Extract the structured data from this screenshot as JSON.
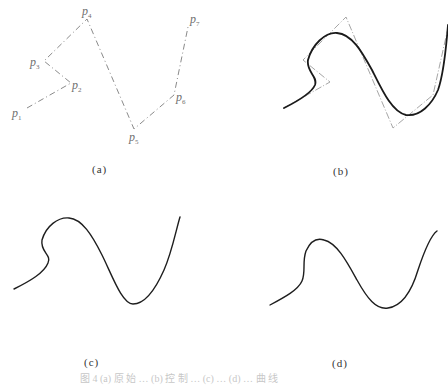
{
  "figure": {
    "panels": [
      {
        "id": "a",
        "label": "(a)",
        "content": "control polygon P1..P7"
      },
      {
        "id": "b",
        "label": "(b)",
        "content": "curve with control polygon"
      },
      {
        "id": "c",
        "label": "(c)",
        "content": "curve"
      },
      {
        "id": "d",
        "label": "(d)",
        "content": "smoothed curve"
      }
    ],
    "points": [
      {
        "name": "p",
        "sub": "1"
      },
      {
        "name": "p",
        "sub": "2"
      },
      {
        "name": "p",
        "sub": "3"
      },
      {
        "name": "p",
        "sub": "4"
      },
      {
        "name": "p",
        "sub": "5"
      },
      {
        "name": "p",
        "sub": "6"
      },
      {
        "name": "p",
        "sub": "7"
      }
    ],
    "caption": "图 4  (a) 原 始 …  (b) 控 制 …  (c) …  (d) … 曲 线",
    "colors": {
      "polygon": "#8a8a8a",
      "curve": "#1a1a1a",
      "text": "#333333"
    }
  }
}
